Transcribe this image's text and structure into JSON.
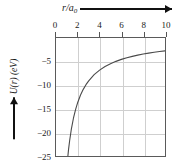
{
  "figure": {
    "background_color": "#ffffff",
    "frame_color": "#5a5a5a",
    "grid_color": "#cfcfcf",
    "curve_color": "#4a4a4a"
  },
  "axes": {
    "x_title_text": "r/a",
    "x_title_subscript": "0",
    "x_title_arrow": "right-arrow",
    "x_ticklabels": [
      "0",
      "2",
      "4",
      "6",
      "8",
      "10"
    ],
    "x_tickvalues": [
      0,
      2,
      4,
      6,
      8,
      10
    ],
    "y_title_text": "U(r) (eV)",
    "y_title_arrow": "up-arrow",
    "y_ticklabels": [
      "−5",
      "−10",
      "−15",
      "−20",
      "−25"
    ],
    "y_tickvalues": [
      -5,
      -10,
      -15,
      -20,
      -25
    ]
  },
  "chart_data": {
    "type": "line",
    "title": "",
    "xlabel": "r/a₀",
    "ylabel": "U(r) (eV)",
    "xlim": [
      0,
      10
    ],
    "ylim": [
      -25,
      0
    ],
    "grid": true,
    "legend": "none",
    "x_axis_position": "top",
    "formula": "U(r) = -27.2 / (r/a0)  eV",
    "series": [
      {
        "name": "U(r)",
        "color": "#4a4a4a",
        "x": [
          1.09,
          1.15,
          1.25,
          1.4,
          1.6,
          1.8,
          2.0,
          2.25,
          2.5,
          2.75,
          3.0,
          3.5,
          4.0,
          4.5,
          5.0,
          5.5,
          6.0,
          6.5,
          7.0,
          7.5,
          8.0,
          8.5,
          9.0,
          9.5,
          10.0
        ],
        "y": [
          -25.0,
          -23.65,
          -21.76,
          -19.43,
          -17.0,
          -15.11,
          -13.6,
          -12.09,
          -10.88,
          -9.89,
          -9.07,
          -7.77,
          -6.8,
          -6.04,
          -5.44,
          -4.95,
          -4.53,
          -4.18,
          -3.89,
          -3.63,
          -3.4,
          -3.2,
          -3.02,
          -2.86,
          -2.72
        ]
      }
    ]
  }
}
